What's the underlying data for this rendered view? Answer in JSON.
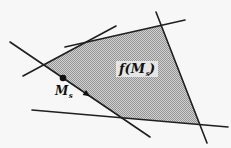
{
  "figure": {
    "background": "#f7f7f7",
    "line_color": "#1f1f1f",
    "marker_color": "#111111",
    "pattern_light": "#d2d2d2",
    "pattern_dark": "#949494",
    "label_halo": "#e9e9e9",
    "labels": {
      "point_label": {
        "main": "M",
        "sub": "s"
      },
      "image_label": {
        "pre": "f(M",
        "sub": "s",
        "post": ")"
      }
    },
    "lines": [
      {
        "name": "m-line",
        "x1": 10,
        "y1": 42,
        "x2": 150,
        "y2": 137
      },
      {
        "name": "upper-left-line",
        "x1": 23,
        "y1": 76,
        "x2": 116,
        "y2": 26
      },
      {
        "name": "top-line",
        "x1": 65,
        "y1": 47,
        "x2": 185,
        "y2": 20
      },
      {
        "name": "right-line",
        "x1": 156,
        "y1": 12,
        "x2": 207,
        "y2": 143
      },
      {
        "name": "bottom-line",
        "x1": 32,
        "y1": 110,
        "x2": 228,
        "y2": 127
      }
    ],
    "region": {
      "name": "shaded-region",
      "vertices": [
        [
          43.7,
          64.9
        ],
        [
          85.6,
          42.3
        ],
        [
          161.2,
          25.3
        ],
        [
          199.8,
          124.6
        ],
        [
          121.6,
          117.8
        ]
      ]
    },
    "point": {
      "x": 63,
      "y": 78,
      "r": 3.3
    },
    "arrow": {
      "points": [
        [
          90.5,
          96.5
        ],
        [
          82.6,
          95.0
        ],
        [
          86.0,
          90.0
        ]
      ]
    }
  }
}
